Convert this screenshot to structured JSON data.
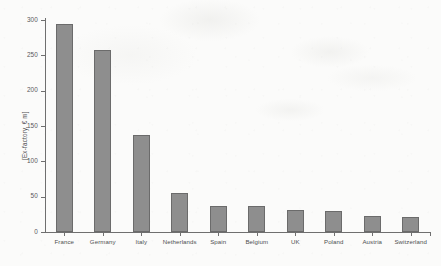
{
  "chart_data": {
    "type": "bar",
    "title": "",
    "subtitle": "",
    "xlabel": "",
    "ylabel": "[Ex-factory, € m]",
    "categories": [
      "France",
      "Germany",
      "Italy",
      "Netherlands",
      "Spain",
      "Belgium",
      "UK",
      "Poland",
      "Austria",
      "Switzerland"
    ],
    "values": [
      295,
      258,
      137,
      55,
      37,
      37,
      31,
      30,
      23,
      21
    ],
    "ylim": [
      0,
      300
    ],
    "y_ticks": [
      0,
      50,
      100,
      150,
      200,
      250,
      300
    ],
    "y_tick_labels": [
      "0",
      "50",
      "100",
      "150",
      "200",
      "250",
      "300"
    ],
    "grid": false,
    "legend": null,
    "legend_position": "none",
    "series": [
      {
        "name": "",
        "values": [
          295,
          258,
          137,
          55,
          37,
          37,
          31,
          30,
          23,
          21
        ]
      }
    ],
    "colors": {
      "bar_fill": "#8e8e8e",
      "bar_edge": "#6b6b6b",
      "axis": "#6f6f6f",
      "tick_label": "#58585a",
      "background": "#fbfbfa"
    }
  }
}
